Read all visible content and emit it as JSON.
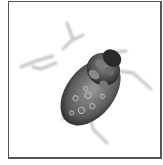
{
  "image": {
    "subject": "tick",
    "style": "grayscale illustration",
    "frame_color": "#555555",
    "background_color": "#ffffff",
    "body_dark": "#1e1e1e",
    "body_mid": "#6a6a6a",
    "leg_color": "#c8c8c8"
  }
}
